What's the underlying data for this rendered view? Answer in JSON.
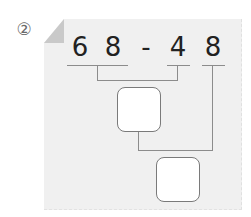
{
  "problem": {
    "number_label": "②",
    "expression": {
      "tokens": [
        "6",
        "8",
        "-",
        "4",
        "8"
      ]
    },
    "answer_boxes": [
      {
        "id": "intermediate",
        "value": ""
      },
      {
        "id": "final",
        "value": ""
      }
    ]
  }
}
